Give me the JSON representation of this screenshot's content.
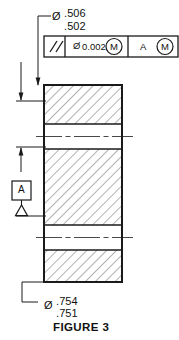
{
  "figure": {
    "caption": "FIGURE 3",
    "type": "engineering-drawing",
    "standard": "GD&T / ASME Y14.5",
    "view": "sectioned front view of cylindrical part"
  },
  "top_dimension": {
    "diameter_symbol": "Ø",
    "upper_limit": ".506",
    "lower_limit": ".502",
    "applies_to": "inner bore / upper feature"
  },
  "bottom_dimension": {
    "diameter_symbol": "Ø",
    "upper_limit": ".754",
    "lower_limit": ".751",
    "applies_to": "outer diameter"
  },
  "feature_control_frame": {
    "geometric_characteristic_symbol": "//",
    "geometric_characteristic_name": "parallelism",
    "tolerance_diameter_symbol": "Ø",
    "tolerance_value": "0.002",
    "tolerance_modifier": "M",
    "datum_reference": "A",
    "datum_modifier": "M",
    "compartments": [
      "//",
      "Ø0.002 Ⓜ",
      "A Ⓜ"
    ]
  },
  "datum_feature": {
    "letter": "A",
    "symbol": "datum-feature-triangle"
  },
  "colors": {
    "line": "#1a1a1a",
    "hatch": "#555555",
    "background": "#ffffff",
    "text": "#111111"
  }
}
